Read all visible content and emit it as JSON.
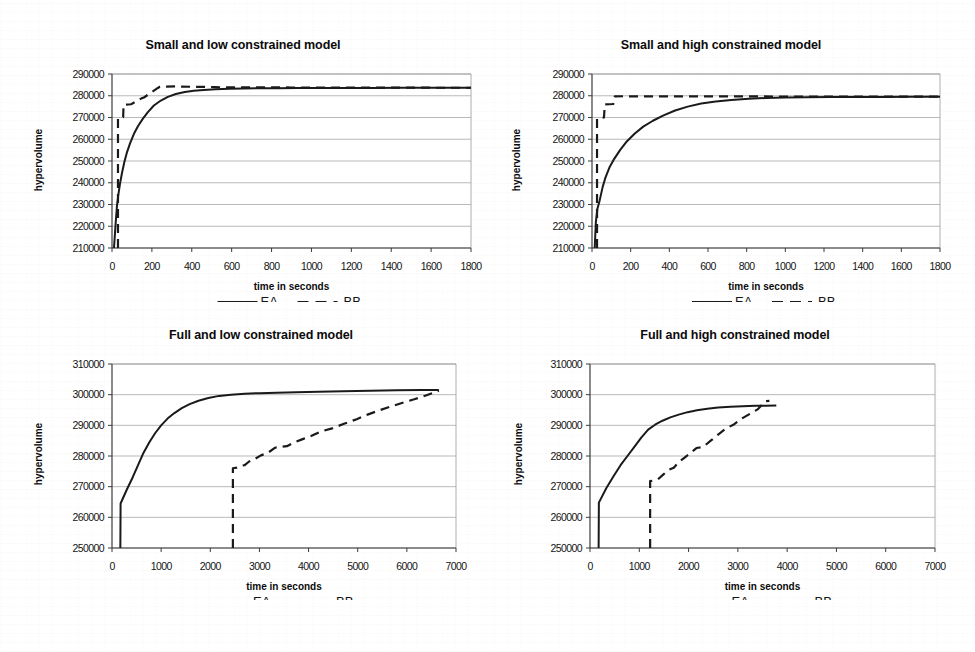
{
  "figure": {
    "background": "#ffffff",
    "ink_color": "#1a1a1a",
    "grid_color": "#9a9a9a",
    "axis_color": "#555555"
  },
  "legend": {
    "ea_label": "EA",
    "bb_label": "BB",
    "ea_style": "solid",
    "bb_style": "dashed"
  },
  "chart_data": [
    {
      "id": "small-low",
      "type": "line",
      "title": "Small and low constrained model",
      "xlabel": "time in seconds",
      "ylabel": "hypervolume",
      "xlim": [
        0,
        1800
      ],
      "ylim": [
        210000,
        290000
      ],
      "xticks": [
        0,
        200,
        400,
        600,
        800,
        1000,
        1200,
        1400,
        1600,
        1800
      ],
      "yticks": [
        210000,
        220000,
        230000,
        240000,
        250000,
        260000,
        270000,
        280000,
        290000
      ],
      "grid": "horizontal",
      "legend_position": "below-axis-title",
      "series": [
        {
          "name": "EA",
          "style": "solid",
          "x": [
            10,
            18,
            25,
            32,
            40,
            50,
            62,
            75,
            90,
            110,
            130,
            155,
            180,
            210,
            245,
            280,
            320,
            365,
            410,
            460,
            520,
            590,
            660,
            740,
            830,
            930,
            1040,
            1160,
            1300,
            1450,
            1620,
            1800
          ],
          "y": [
            210000,
            221000,
            229500,
            234500,
            239500,
            244500,
            249500,
            254000,
            258000,
            262500,
            266000,
            269500,
            272500,
            275500,
            277800,
            279500,
            280800,
            281700,
            282300,
            282700,
            283000,
            283200,
            283350,
            283450,
            283500,
            283550,
            283580,
            283600,
            283620,
            283640,
            283650,
            283660
          ]
        },
        {
          "name": "BB",
          "style": "dashed",
          "x": [
            30,
            30,
            36,
            56,
            58,
            95,
            100,
            150,
            160,
            230,
            240,
            330,
            340,
            520,
            540,
            900,
            920,
            1400,
            1800
          ],
          "y": [
            210000,
            269800,
            269800,
            270200,
            275800,
            276100,
            276300,
            278900,
            279200,
            283600,
            284100,
            284300,
            284200,
            284000,
            283900,
            283800,
            283750,
            283700,
            283680
          ]
        }
      ]
    },
    {
      "id": "small-high",
      "type": "line",
      "title": "Small and high constrained model",
      "xlabel": "time in seconds",
      "ylabel": "hypervolume",
      "xlim": [
        0,
        1800
      ],
      "ylim": [
        210000,
        290000
      ],
      "xticks": [
        0,
        200,
        400,
        600,
        800,
        1000,
        1200,
        1400,
        1600,
        1800
      ],
      "yticks": [
        210000,
        220000,
        230000,
        240000,
        250000,
        260000,
        270000,
        280000,
        290000
      ],
      "grid": "horizontal",
      "legend_position": "below-axis-title",
      "series": [
        {
          "name": "EA",
          "style": "solid",
          "x": [
            14,
            20,
            28,
            40,
            55,
            70,
            90,
            115,
            145,
            180,
            220,
            265,
            315,
            370,
            430,
            495,
            565,
            640,
            720,
            810,
            900,
            1000,
            1110,
            1230,
            1360,
            1500,
            1650,
            1800
          ],
          "y": [
            210000,
            222000,
            228000,
            232000,
            238000,
            242500,
            247000,
            251000,
            255000,
            259000,
            262500,
            265800,
            268500,
            271000,
            273200,
            275000,
            276400,
            277400,
            278100,
            278600,
            278950,
            279150,
            279300,
            279400,
            279450,
            279480,
            279500,
            279500
          ]
        },
        {
          "name": "BB",
          "style": "dashed",
          "x": [
            26,
            26,
            34,
            62,
            66,
            110,
            118,
            175,
            185,
            700,
            1000,
            1400,
            1800
          ],
          "y": [
            210000,
            269500,
            269600,
            270000,
            276000,
            276200,
            279700,
            279800,
            279750,
            279700,
            279650,
            279620,
            279600
          ]
        }
      ]
    },
    {
      "id": "full-low",
      "type": "line",
      "title": "Full and low constrained model",
      "xlabel": "time in seconds",
      "ylabel": "hypervolume",
      "xlim": [
        0,
        7000
      ],
      "ylim": [
        250000,
        310000
      ],
      "xticks": [
        0,
        1000,
        2000,
        3000,
        4000,
        5000,
        6000,
        7000
      ],
      "yticks": [
        250000,
        260000,
        270000,
        280000,
        290000,
        300000,
        310000
      ],
      "grid": "horizontal",
      "legend_position": "below-axis-title",
      "series": [
        {
          "name": "EA",
          "style": "solid",
          "x": [
            170,
            175,
            300,
            420,
            530,
            640,
            760,
            880,
            1000,
            1130,
            1270,
            1420,
            1580,
            1760,
            1960,
            2180,
            2420,
            2700,
            3000,
            3350,
            3750,
            4200,
            4700,
            5250,
            5800,
            6300,
            6650
          ],
          "y": [
            250000,
            264500,
            269000,
            273000,
            277000,
            281000,
            284500,
            287500,
            290000,
            292200,
            294000,
            295600,
            296900,
            298000,
            298900,
            299600,
            300000,
            300300,
            300500,
            300650,
            300800,
            300950,
            301100,
            301250,
            301400,
            301500,
            301550
          ]
        },
        {
          "name": "BB",
          "style": "dashed",
          "x": [
            2460,
            2460,
            2540,
            2620,
            2700,
            2790,
            2900,
            3030,
            3170,
            3320,
            3420,
            3560,
            3720,
            3880,
            4050,
            4250,
            4480,
            4720,
            4980,
            5200,
            5420,
            5650,
            5900,
            6150,
            6400,
            6650
          ],
          "y": [
            250000,
            276000,
            276200,
            276800,
            277000,
            278200,
            279000,
            280200,
            281000,
            282700,
            283000,
            283200,
            284500,
            285500,
            286500,
            288000,
            289000,
            290500,
            292000,
            293500,
            294800,
            296000,
            297300,
            298500,
            299800,
            301300
          ]
        }
      ]
    },
    {
      "id": "full-high",
      "type": "line",
      "title": "Full and high constrained model",
      "xlabel": "time in seconds",
      "ylabel": "hypervolume",
      "xlim": [
        0,
        7000
      ],
      "ylim": [
        250000,
        310000
      ],
      "xticks": [
        0,
        1000,
        2000,
        3000,
        4000,
        5000,
        6000,
        7000
      ],
      "yticks": [
        250000,
        260000,
        270000,
        280000,
        290000,
        300000,
        310000
      ],
      "grid": "horizontal",
      "legend_position": "below-axis-title",
      "series": [
        {
          "name": "EA",
          "style": "solid",
          "x": [
            175,
            180,
            330,
            480,
            620,
            760,
            900,
            1040,
            1180,
            1320,
            1470,
            1630,
            1800,
            1980,
            2170,
            2380,
            2600,
            2850,
            3100,
            3350,
            3550,
            3780
          ],
          "y": [
            250000,
            264800,
            269500,
            273500,
            277000,
            280000,
            283000,
            286000,
            288600,
            290200,
            291500,
            292600,
            293500,
            294300,
            294900,
            295400,
            295800,
            296100,
            296250,
            296350,
            296400,
            296450
          ]
        },
        {
          "name": "BB",
          "style": "dashed",
          "x": [
            1220,
            1220,
            1290,
            1380,
            1490,
            1600,
            1700,
            1800,
            1920,
            2040,
            2160,
            2300,
            2450,
            2600,
            2760,
            2920,
            3080,
            3250,
            3400,
            3560,
            3640
          ],
          "y": [
            250000,
            271800,
            272000,
            272400,
            274000,
            275500,
            276200,
            278000,
            279500,
            281000,
            282600,
            283000,
            285000,
            287000,
            289000,
            290300,
            292200,
            293800,
            295200,
            297900,
            298000
          ]
        }
      ]
    }
  ]
}
